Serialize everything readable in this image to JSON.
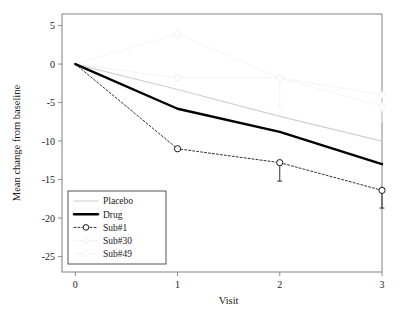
{
  "chart_data": {
    "type": "line",
    "title": "",
    "xlabel": "Visit",
    "ylabel": "Mean change from baseline",
    "x": [
      0,
      1,
      2,
      3
    ],
    "xticklabels": [
      "0",
      "1",
      "2",
      "3"
    ],
    "yticklabels": [
      "5",
      "0",
      "-5",
      "-10",
      "-15",
      "-20",
      "-25"
    ],
    "ytickvalues": [
      5,
      0,
      -5,
      -10,
      -15,
      -20,
      -25
    ],
    "xlim": [
      -0.13,
      3.0
    ],
    "ylim": [
      -27,
      6.5
    ],
    "grid": false,
    "legend_position": "lower left",
    "series": [
      {
        "name": "Placebo",
        "values": [
          0,
          -3.3,
          -6.8,
          -10.0
        ],
        "color": "#d0d0d0",
        "width": 1.2,
        "dash": "none",
        "marker": "none",
        "errors": []
      },
      {
        "name": "Drug",
        "values": [
          0,
          -5.8,
          -8.8,
          -13.0
        ],
        "color": "#000000",
        "width": 2.4,
        "dash": "none",
        "marker": "none",
        "errors": []
      },
      {
        "name": "Sub#1",
        "values": [
          0,
          -11.0,
          -12.8,
          -16.4
        ],
        "color": "#1a1a1a",
        "width": 0.9,
        "dash": "2,2",
        "marker": "circle",
        "errors": [
          0,
          0,
          2.4,
          2.3
        ]
      },
      {
        "name": "Sub#30",
        "values": [
          0,
          -1.8,
          -1.8,
          -4.0
        ],
        "color": "#f2f2f2",
        "width": 0.9,
        "dash": "none",
        "marker": "circle",
        "errors": [
          0,
          0,
          3.8,
          2.2
        ]
      },
      {
        "name": "Sub#49",
        "values": [
          0,
          3.9,
          -1.8,
          -5.5
        ],
        "color": "#f4f4f4",
        "width": 0.9,
        "dash": "none",
        "marker": "diamond",
        "errors": [
          0,
          0,
          0,
          2.0
        ]
      }
    ]
  },
  "legend": {
    "entries": [
      {
        "label": "Placebo"
      },
      {
        "label": "Drug"
      },
      {
        "label": "Sub#1"
      },
      {
        "label": "Sub#30"
      },
      {
        "label": "Sub#49"
      }
    ]
  },
  "colors": {
    "frame": "#8c8c8c",
    "text": "#1a1a1a",
    "background": "#ffffff"
  }
}
